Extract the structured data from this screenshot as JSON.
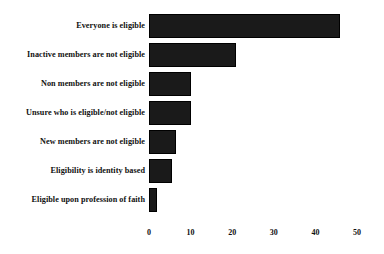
{
  "chart_data": {
    "type": "bar",
    "orientation": "horizontal",
    "title": "",
    "subtitle": "",
    "xlabel": "",
    "ylabel": "",
    "xlim": [
      0,
      50
    ],
    "xticks": [
      0,
      10,
      20,
      30,
      40,
      50
    ],
    "xticklabels": [
      "0",
      "10",
      "20",
      "30",
      "40",
      "50"
    ],
    "grid": false,
    "legend": null,
    "categories": [
      "Everyone is eligible",
      "Inactive members are not eligible",
      "Non members are not eligible",
      "Unsure who is eligible/not eligible",
      "New members are not eligible",
      "Eligibility is identity based",
      "Eligible upon profession of faith"
    ],
    "values": [
      46,
      21,
      10,
      10,
      6.5,
      5.5,
      2
    ],
    "bar_color": "#1a1a1a",
    "background_color": "#ffffff"
  }
}
